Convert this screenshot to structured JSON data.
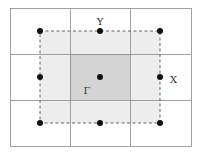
{
  "diagram": {
    "title": "",
    "labels": {
      "top": "Y",
      "right": "X",
      "center": "Γ"
    },
    "colors": {
      "background": "#ffffff",
      "grid_line": "#8a8a8a",
      "outer_shade": "#ededed",
      "center_shade": "#d4d4d4",
      "dashed_border": "#555555",
      "point": "#111111",
      "label": "#333333"
    },
    "grid": {
      "rows": 3,
      "cols": 3
    },
    "points": [
      {
        "name": "corner-top-left",
        "x": 40,
        "y": 31
      },
      {
        "name": "Y",
        "x": 100,
        "y": 31
      },
      {
        "name": "corner-top-right",
        "x": 160,
        "y": 31
      },
      {
        "name": "edge-left",
        "x": 40,
        "y": 77
      },
      {
        "name": "Gamma",
        "x": 100,
        "y": 77
      },
      {
        "name": "X",
        "x": 160,
        "y": 77
      },
      {
        "name": "corner-bottom-left",
        "x": 40,
        "y": 123
      },
      {
        "name": "edge-bottom",
        "x": 100,
        "y": 123
      },
      {
        "name": "corner-bottom-right",
        "x": 160,
        "y": 123
      }
    ]
  }
}
